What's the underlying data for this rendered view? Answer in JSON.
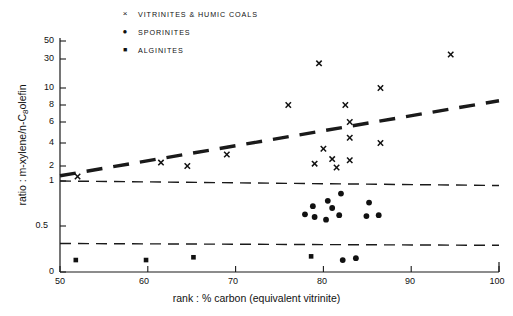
{
  "chart_data": {
    "type": "scatter",
    "title": "",
    "xlabel": "rank : % carbon  (equivalent vitrinite)",
    "ylabel_full": "ratio : m-xylene/n-C8olefin",
    "ylabel_prefix": "ratio : ",
    "ylabel_mid": "m-xylene/n-C",
    "ylabel_sub": "8",
    "ylabel_suffix": "olefin",
    "xlim": [
      50,
      100
    ],
    "ylim_note": "non-linear (log-like) axis, ticks: 0, 0.5, 1, 2, 4, 6, 8, 10, 30, 50",
    "grid": false,
    "legend_position": "top-center",
    "xticks": [
      "50",
      "60",
      "70",
      "80",
      "90",
      "100"
    ],
    "yticks": [
      "50",
      "30",
      "10",
      "8",
      "6",
      "4",
      "2",
      "1",
      "0.5",
      "0"
    ],
    "legend": [
      {
        "marker": "x",
        "symbol": "×",
        "label": "VITRINITES & HUMIC COALS"
      },
      {
        "marker": "circle",
        "symbol": "●",
        "label": "SPORINITES"
      },
      {
        "marker": "square",
        "symbol": "■",
        "label": "ALGINITES"
      }
    ],
    "series": [
      {
        "name": "VITRINITES & HUMIC COALS",
        "marker": "x",
        "points": [
          {
            "x": 52.0,
            "y": 1.3
          },
          {
            "x": 61.5,
            "y": 2.3
          },
          {
            "x": 64.5,
            "y": 2.0
          },
          {
            "x": 69.0,
            "y": 3.0
          },
          {
            "x": 76.0,
            "y": 8.0
          },
          {
            "x": 79.5,
            "y": 27.0
          },
          {
            "x": 80.0,
            "y": 3.5
          },
          {
            "x": 79.0,
            "y": 2.2
          },
          {
            "x": 81.0,
            "y": 2.6
          },
          {
            "x": 81.5,
            "y": 1.9
          },
          {
            "x": 82.5,
            "y": 8.0
          },
          {
            "x": 83.0,
            "y": 4.5
          },
          {
            "x": 83.0,
            "y": 6.0
          },
          {
            "x": 83.0,
            "y": 2.5
          },
          {
            "x": 86.5,
            "y": 10.0
          },
          {
            "x": 86.5,
            "y": 4.0
          },
          {
            "x": 94.5,
            "y": 35.0
          }
        ]
      },
      {
        "name": "SPORINITES",
        "marker": "circle",
        "points": [
          {
            "x": 78.8,
            "y": 0.72
          },
          {
            "x": 80.5,
            "y": 0.78
          },
          {
            "x": 82.0,
            "y": 0.86
          },
          {
            "x": 77.9,
            "y": 0.63
          },
          {
            "x": 79.0,
            "y": 0.6
          },
          {
            "x": 81.0,
            "y": 0.7
          },
          {
            "x": 80.3,
            "y": 0.57
          },
          {
            "x": 81.8,
            "y": 0.62
          },
          {
            "x": 85.2,
            "y": 0.76
          },
          {
            "x": 84.9,
            "y": 0.61
          },
          {
            "x": 86.3,
            "y": 0.62
          },
          {
            "x": 82.2,
            "y": 0.13
          },
          {
            "x": 83.7,
            "y": 0.15
          }
        ]
      },
      {
        "name": "ALGINITES",
        "marker": "square",
        "points": [
          {
            "x": 51.8,
            "y": 0.13
          },
          {
            "x": 59.8,
            "y": 0.13
          },
          {
            "x": 65.2,
            "y": 0.16
          },
          {
            "x": 78.6,
            "y": 0.17
          }
        ]
      }
    ],
    "trend_lines": [
      {
        "name": "vitrinite-trend",
        "style": "thick-dashed",
        "from": {
          "x": 50,
          "y": 1.35
        },
        "to": {
          "x": 100,
          "y": 8.5
        }
      },
      {
        "name": "upper-boundary",
        "style": "thin-dashed-horizontal",
        "from": {
          "x": 50,
          "y": 1.0
        },
        "to": {
          "x": 100,
          "y": 0.95
        }
      },
      {
        "name": "lower-boundary",
        "style": "thin-dashed-horizontal",
        "from": {
          "x": 50,
          "y": 0.31
        },
        "to": {
          "x": 100,
          "y": 0.29
        }
      }
    ]
  }
}
